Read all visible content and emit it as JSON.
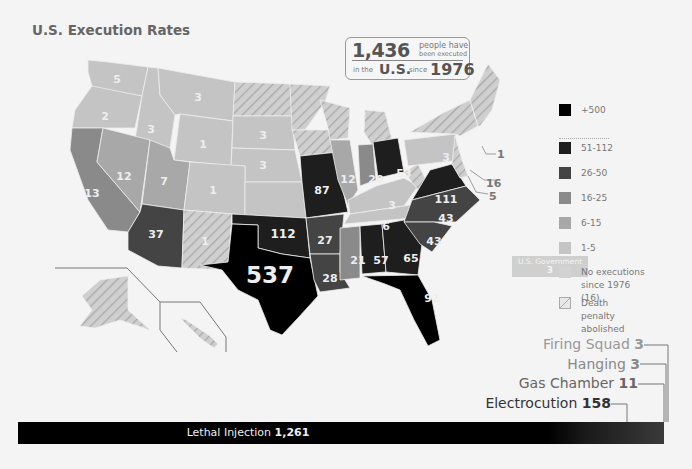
{
  "title": "U.S. Execution Rates",
  "summary": {
    "count": "1,436",
    "line1": "people have",
    "line2": "been executed",
    "in_the": "in the",
    "country": "U.S.",
    "since": "since",
    "year": "1976"
  },
  "legend": {
    "items": [
      {
        "label": "+500",
        "color": "#000000"
      },
      {
        "label": "51-112",
        "color": "#1e1e1e"
      },
      {
        "label": "26-50",
        "color": "#444444"
      },
      {
        "label": "16-25",
        "color": "#8a8a8a"
      },
      {
        "label": "6-15",
        "color": "#a8a8a8"
      },
      {
        "label": "1-5",
        "color": "#c4c4c4"
      },
      {
        "label": "No executions since 1976 (16)",
        "color": "#d2d2d2"
      },
      {
        "label": "Death penalty abolished",
        "color": "hatched"
      }
    ]
  },
  "us_government": {
    "label": "U.S. Government",
    "value": "3"
  },
  "states": [
    {
      "name": "WA",
      "value": "5"
    },
    {
      "name": "OR",
      "value": "2"
    },
    {
      "name": "ID",
      "value": "3"
    },
    {
      "name": "MT",
      "value": "3"
    },
    {
      "name": "WY",
      "value": "1"
    },
    {
      "name": "SD",
      "value": "3"
    },
    {
      "name": "NE",
      "value": "3"
    },
    {
      "name": "CA",
      "value": "13"
    },
    {
      "name": "NV",
      "value": "12"
    },
    {
      "name": "UT",
      "value": "7"
    },
    {
      "name": "CO",
      "value": "1"
    },
    {
      "name": "AZ",
      "value": "37"
    },
    {
      "name": "NM",
      "value": "1"
    },
    {
      "name": "OK",
      "value": "112"
    },
    {
      "name": "TX",
      "value": "537"
    },
    {
      "name": "MO",
      "value": "87"
    },
    {
      "name": "AR",
      "value": "27"
    },
    {
      "name": "LA",
      "value": "28"
    },
    {
      "name": "IL",
      "value": "12"
    },
    {
      "name": "IN",
      "value": "20"
    },
    {
      "name": "OH",
      "value": "53"
    },
    {
      "name": "KY",
      "value": "3"
    },
    {
      "name": "TN",
      "value": "6"
    },
    {
      "name": "MS",
      "value": "21"
    },
    {
      "name": "AL",
      "value": "57"
    },
    {
      "name": "GA",
      "value": "65"
    },
    {
      "name": "FL",
      "value": "92"
    },
    {
      "name": "SC",
      "value": "43"
    },
    {
      "name": "NC",
      "value": "43"
    },
    {
      "name": "VA",
      "value": "111"
    },
    {
      "name": "PA",
      "value": "3"
    },
    {
      "name": "CT",
      "value": "1"
    },
    {
      "name": "DE",
      "value": "16"
    },
    {
      "name": "MD",
      "value": "5"
    }
  ],
  "methods": [
    {
      "name": "Firing Squad",
      "value": "3",
      "color": "#999999"
    },
    {
      "name": "Hanging",
      "value": "3",
      "color": "#888888"
    },
    {
      "name": "Gas Chamber",
      "value": "11",
      "color": "#666666"
    },
    {
      "name": "Electrocution",
      "value": "158",
      "color": "#333333"
    }
  ],
  "lethal_injection": {
    "name": "Lethal Injection",
    "value": "1,261"
  }
}
